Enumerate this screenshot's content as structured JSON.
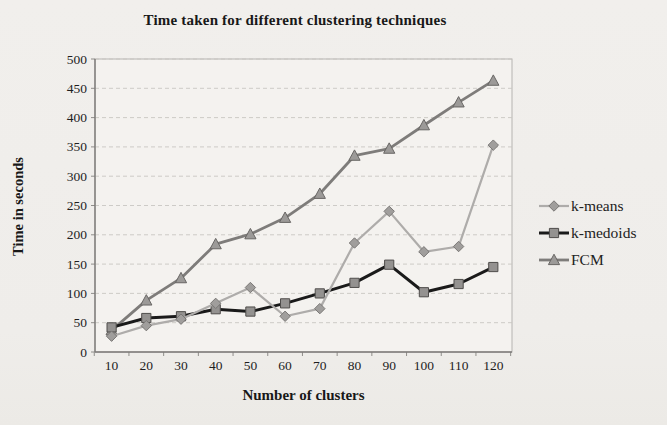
{
  "page": {
    "background": "#f0eeeb"
  },
  "chart_data": {
    "type": "line",
    "title": "Time taken for different clustering techniques",
    "xlabel": "Number of clusters",
    "ylabel": "Time in seconds",
    "categories": [
      10,
      20,
      30,
      40,
      50,
      60,
      70,
      80,
      90,
      100,
      110,
      120
    ],
    "y_ticks": [
      0,
      50,
      100,
      150,
      200,
      250,
      300,
      350,
      400,
      450,
      500
    ],
    "ylim": [
      0,
      500
    ],
    "grid": true,
    "legend_position": "right",
    "series": [
      {
        "name": "FCM",
        "marker": "triangle",
        "line_color": "#7e7c7a",
        "marker_fill": "#9c9a98",
        "marker_stroke": "#686664",
        "line_width": 2.8,
        "values": [
          37,
          88,
          126,
          184,
          201,
          229,
          270,
          335,
          347,
          387,
          426,
          463
        ]
      },
      {
        "name": "k-medoids",
        "marker": "square",
        "line_color": "#1a1a1a",
        "marker_fill": "#949290",
        "marker_stroke": "#4f4d4b",
        "line_width": 3,
        "values": [
          42,
          58,
          61,
          73,
          69,
          83,
          100,
          118,
          149,
          102,
          116,
          145
        ]
      },
      {
        "name": "k-means",
        "marker": "diamond",
        "line_color": "#aeacaa",
        "marker_fill": "#a09e9c",
        "marker_stroke": "#7a7876",
        "line_width": 2.2,
        "values": [
          27,
          45,
          56,
          83,
          110,
          61,
          74,
          186,
          240,
          171,
          180,
          353
        ]
      }
    ],
    "legend_order": [
      "k-means",
      "k-medoids",
      "FCM"
    ]
  }
}
